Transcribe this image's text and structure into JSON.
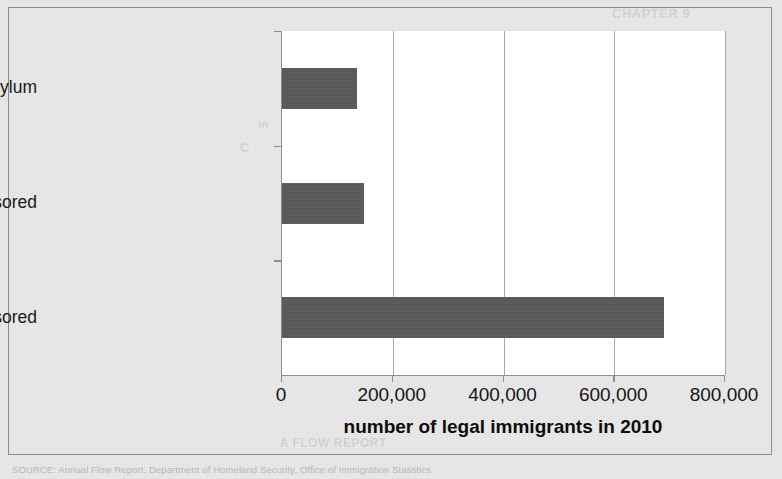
{
  "figure": {
    "source_note": "SOURCE: Annual Flow Report, Department of Homeland Security, Office of Immigration Statistics"
  },
  "page_bleed": [
    {
      "text": "CHAPTER 9",
      "x": 612,
      "y": 6,
      "size": 13
    },
    {
      "text": "numbers of",
      "x": 436,
      "y": 46,
      "size": 12
    },
    {
      "text": "2010",
      "x": 520,
      "y": 60,
      "size": 15
    },
    {
      "text": "immigration to the United States",
      "x": 330,
      "y": 92,
      "size": 11
    },
    {
      "text": "in",
      "x": 258,
      "y": 118,
      "size": 11
    },
    {
      "text": "C",
      "x": 240,
      "y": 140,
      "size": 13
    },
    {
      "text": "that year",
      "x": 430,
      "y": 140,
      "size": 11
    },
    {
      "text": "than 1 million",
      "x": 470,
      "y": 164,
      "size": 11
    },
    {
      "text": "the law",
      "x": 400,
      "y": 190,
      "size": 11
    },
    {
      "text": "legal",
      "x": 300,
      "y": 214,
      "size": 11
    },
    {
      "text": "permanent",
      "x": 380,
      "y": 240,
      "size": 11
    },
    {
      "text": "residents",
      "x": 300,
      "y": 266,
      "size": 11
    },
    {
      "text": "and",
      "x": 470,
      "y": 266,
      "size": 11
    },
    {
      "text": "employment",
      "x": 340,
      "y": 292,
      "size": 11
    },
    {
      "text": "sponsored",
      "x": 330,
      "y": 318,
      "size": 13
    },
    {
      "text": "THE STATES",
      "x": 470,
      "y": 318,
      "size": 15
    },
    {
      "text": "admitted as refugees or asylees",
      "x": 300,
      "y": 344,
      "size": 11
    },
    {
      "text": "A FLOW REPORT",
      "x": 280,
      "y": 436,
      "size": 12
    }
  ],
  "chart_data": {
    "type": "bar",
    "orientation": "horizontal",
    "title": "",
    "xlabel": "number of legal immigrants in 2010",
    "ylabel": "",
    "categories": [
      "family sponsored",
      "employment sponsored",
      "refugees/political asylum"
    ],
    "values": [
      690000,
      148000,
      136000
    ],
    "xlim": [
      0,
      800000
    ],
    "xticks": [
      0,
      200000,
      400000,
      600000,
      800000
    ],
    "xtick_labels": [
      "0",
      "200,000",
      "400,000",
      "600,000",
      "800,000"
    ],
    "grid": "vertical",
    "legend": "none",
    "bar_color": "#595959",
    "plot_background": "#ffffff",
    "figure_background": "#e9e9e9",
    "axis_color": "#8f8f8f"
  }
}
